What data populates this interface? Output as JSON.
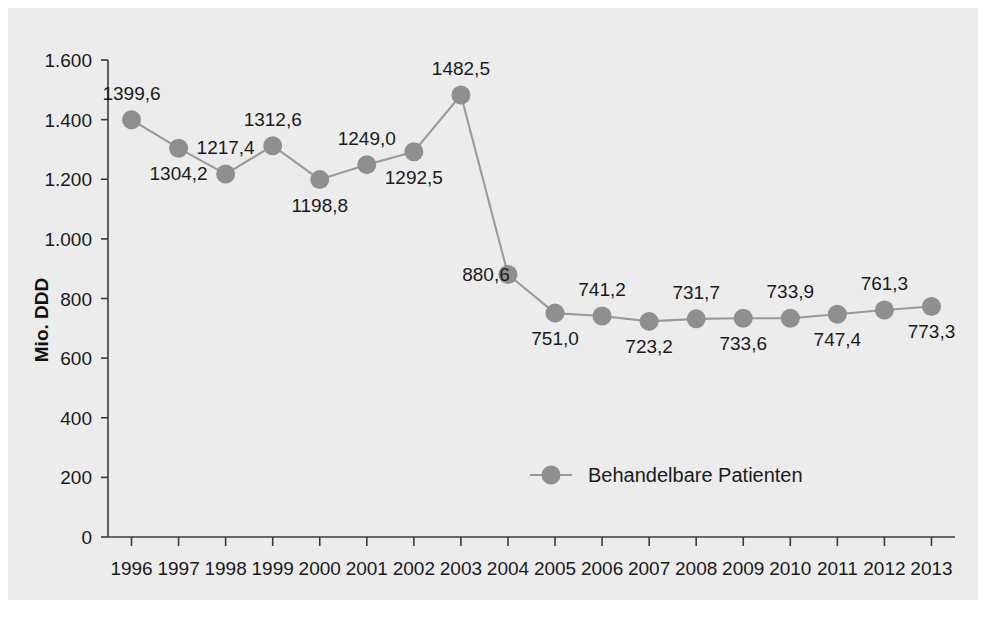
{
  "chart_data": {
    "type": "line",
    "title": "",
    "subtitle": "",
    "xlabel": "",
    "ylabel": "Mio. DDD",
    "categories": [
      "1996",
      "1997",
      "1998",
      "1999",
      "2000",
      "2001",
      "2002",
      "2003",
      "2004",
      "2005",
      "2006",
      "2007",
      "2008",
      "2009",
      "2010",
      "2011",
      "2012",
      "2013"
    ],
    "values": [
      1399.6,
      1304.2,
      1217.4,
      1312.6,
      1198.8,
      1249.0,
      1292.5,
      1482.5,
      880.6,
      751.0,
      741.2,
      723.2,
      731.7,
      733.6,
      733.9,
      747.4,
      761.3,
      773.3
    ],
    "data_labels": [
      "1399,6",
      "1304,2",
      "1217,4",
      "1312,6",
      "1198,8",
      "1249,0",
      "1292,5",
      "1482,5",
      "880,6",
      "751,0",
      "741,2",
      "723,2",
      "731,7",
      "733,6",
      "733,9",
      "747,4",
      "761,3",
      "773,3"
    ],
    "label_positions": [
      "above",
      "below",
      "above",
      "above",
      "below",
      "above",
      "below",
      "above",
      "left",
      "below",
      "above",
      "below",
      "above",
      "below",
      "above",
      "below",
      "above",
      "below"
    ],
    "ylim": [
      0,
      1600
    ],
    "ytick_values": [
      0,
      200,
      400,
      600,
      800,
      1000,
      1200,
      1400,
      1600
    ],
    "ytick_labels": [
      "0",
      "200",
      "400",
      "600",
      "800",
      "1.000",
      "1.200",
      "1.400",
      "1.600"
    ],
    "grid": false,
    "legend": {
      "position": "inside-bottom-center",
      "entries": [
        {
          "name": "Behandelbare Patienten",
          "marker": "circle",
          "color": "#8f8f8f"
        }
      ]
    },
    "series": [
      {
        "name": "Behandelbare Patienten",
        "color": "#8f8f8f",
        "line_color": "#9a9a9a",
        "values": [
          1399.6,
          1304.2,
          1217.4,
          1312.6,
          1198.8,
          1249.0,
          1292.5,
          1482.5,
          880.6,
          751.0,
          741.2,
          723.2,
          731.7,
          733.6,
          733.9,
          747.4,
          761.3,
          773.3
        ]
      }
    ]
  },
  "colors": {
    "plot_background": "#ececec",
    "page_background": "#ffffff",
    "axis": "#3a3a3a",
    "series": "#8f8f8f",
    "text": "#1a1a1a"
  },
  "legend": {
    "entry_label": "Behandelbare Patienten"
  },
  "axes": {
    "y_title": "Mio. DDD"
  }
}
